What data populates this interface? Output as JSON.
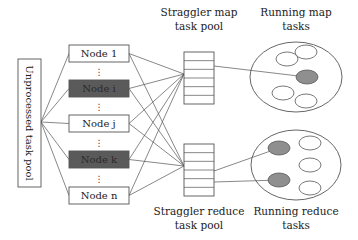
{
  "diagram": {
    "unprocessed_pool": {
      "label": "Unprocessed task pool",
      "x": 18,
      "y": 59,
      "w": 23,
      "h": 128,
      "fanout": [
        41,
        122
      ]
    },
    "nodes": [
      {
        "label": "Node 1",
        "y": 45,
        "straggler": false
      },
      {
        "label": "Node i",
        "y": 80,
        "straggler": true
      },
      {
        "label": "Node j",
        "y": 115,
        "straggler": false
      },
      {
        "label": "Node k",
        "y": 151,
        "straggler": true
      },
      {
        "label": "Node n",
        "y": 187,
        "straggler": false
      }
    ],
    "node_box": {
      "x": 69,
      "w": 60,
      "h": 17
    },
    "ellipsis": "⋮",
    "ellipsis_y": [
      72,
      107,
      143,
      179
    ],
    "straggler_map_pool": {
      "label_line1": "Straggler map",
      "label_line2": "task pool",
      "x": 184,
      "y": 52,
      "w": 30,
      "h": 52,
      "rows": 6,
      "converge": [
        184,
        74
      ]
    },
    "straggler_reduce_pool": {
      "label_line1": "Straggler reduce",
      "label_line2": "task pool",
      "x": 184,
      "y": 144,
      "w": 30,
      "h": 52,
      "rows": 6,
      "converge": [
        184,
        166
      ]
    },
    "running_map": {
      "label_line1": "Running map",
      "label_line2": "tasks",
      "cx": 296,
      "cy": 77,
      "rx": 46,
      "ry": 35,
      "tasks": [
        {
          "cx": 287,
          "cy": 59,
          "filled": false
        },
        {
          "cx": 306,
          "cy": 52,
          "filled": false
        },
        {
          "cx": 307,
          "cy": 77,
          "filled": true
        },
        {
          "cx": 283,
          "cy": 93,
          "filled": false
        },
        {
          "cx": 306,
          "cy": 101,
          "filled": false
        }
      ]
    },
    "running_reduce": {
      "label_line1": "Running reduce",
      "label_line2": "tasks",
      "cx": 296,
      "cy": 165,
      "rx": 45,
      "ry": 35,
      "tasks": [
        {
          "cx": 279,
          "cy": 148,
          "filled": true
        },
        {
          "cx": 310,
          "cy": 143,
          "filled": false
        },
        {
          "cx": 310,
          "cy": 165,
          "filled": false
        },
        {
          "cx": 279,
          "cy": 180,
          "filled": true
        },
        {
          "cx": 310,
          "cy": 188,
          "filled": false
        }
      ]
    },
    "links": [
      {
        "from": [
          214,
          66
        ],
        "to": [
          307,
          77
        ]
      },
      {
        "from": [
          214,
          171
        ],
        "to": [
          279,
          148
        ]
      },
      {
        "from": [
          214,
          182
        ],
        "to": [
          279,
          180
        ]
      }
    ],
    "colors": {
      "straggler_fill": "#5a5a5a",
      "straggler_text": "#2a2a2a",
      "running_task_fill": "#8f8f8f",
      "line": "#555555"
    }
  }
}
